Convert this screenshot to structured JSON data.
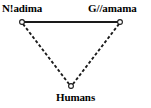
{
  "diagram": {
    "type": "triangle-relationship-diagram",
    "background_color": "#ffffff",
    "stroke_color": "#1a1a1a",
    "nodes": [
      {
        "id": "nadima",
        "label": "N!adima",
        "marker": "open-circle",
        "x": 22,
        "y": 22
      },
      {
        "id": "gamama",
        "label": "G//amama",
        "marker": "open-circle",
        "x": 120,
        "y": 22
      },
      {
        "id": "humans",
        "label": "Humans",
        "marker": "open-circle",
        "x": 71,
        "y": 86
      }
    ],
    "edges": [
      {
        "id": "edge-nadima-gamama",
        "from": "nadima",
        "to": "gamama",
        "style": "solid",
        "width": 2.2
      },
      {
        "id": "edge-nadima-humans",
        "from": "nadima",
        "to": "humans",
        "style": "dashed",
        "width": 1.8,
        "dash_pattern": "3 2"
      },
      {
        "id": "edge-gamama-humans",
        "from": "gamama",
        "to": "humans",
        "style": "dashed",
        "width": 1.8,
        "dash_pattern": "3 2"
      }
    ]
  }
}
